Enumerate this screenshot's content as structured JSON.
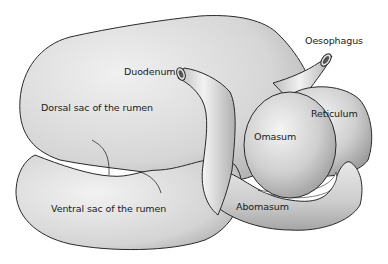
{
  "diagram": {
    "labels": {
      "oesophagus": "Oesophagus",
      "duodenum": "Duodenum",
      "dorsal_sac": "Dorsal sac of the rumen",
      "reticulum": "Reticulum",
      "omasum": "Omasum",
      "ventral_sac": "Ventral sac of the rumen",
      "abomasum": "Abomasum"
    },
    "colors": {
      "outline": "#2a2a2a",
      "fill_light": "#ececec",
      "fill_mid": "#cfcfcf",
      "fill_dark": "#a8a8a8",
      "background": "#ffffff"
    }
  }
}
